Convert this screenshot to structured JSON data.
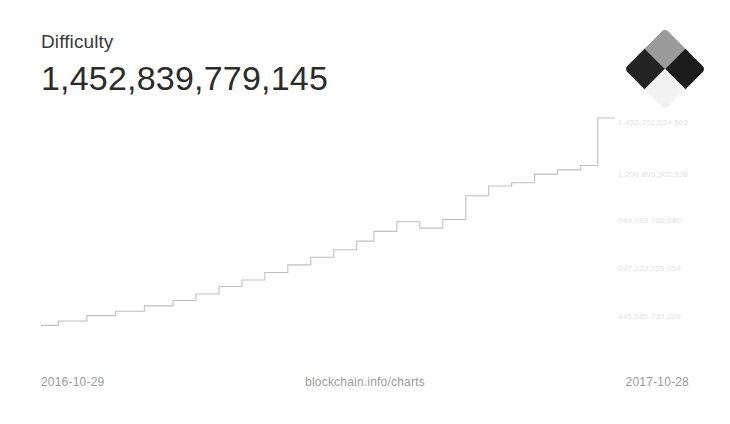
{
  "header": {
    "title": "Difficulty",
    "value": "1,452,839,779,145"
  },
  "logo": {
    "name": "blockchain-diamond-logo",
    "tiles": [
      "#9b9b9b",
      "#1c1c1c",
      "#242424",
      "#f2f2f2"
    ],
    "accent": "#8d8d8d"
  },
  "footer": {
    "date_start": "2016-10-29",
    "source": "blockchain.info/charts",
    "date_end": "2017-10-28"
  },
  "axis": {
    "y_labels": [
      "1,452,791,824,503",
      "1,200,895,302,336",
      "949,058,780,680",
      "697,222,259,054",
      "445,385,737,229"
    ],
    "y_label_tops": [
      118,
      170,
      216,
      264,
      312
    ],
    "line_color": "#c0c0c0",
    "label_color": "#e2e2e2"
  },
  "chart_data": {
    "type": "line",
    "title": "Difficulty",
    "subtitle": "1,452,839,779,145",
    "xlabel": "",
    "ylabel": "Difficulty",
    "source": "blockchain.info/charts",
    "grid": false,
    "legend": false,
    "x_range": [
      "2016-10-29",
      "2017-10-28"
    ],
    "ylim": [
      445385737229,
      1452791824503
    ],
    "y_ticks": [
      445385737229,
      697222259054,
      949058780680,
      1200895302336,
      1452791824503
    ],
    "y_tick_labels": [
      "445,385,737,229",
      "697,222,259,054",
      "949,058,780,680",
      "1,200,895,302,336",
      "1,452,791,824,503"
    ],
    "step_style": "staircase",
    "note": "Bitcoin mining difficulty retargets roughly every two weeks, producing a step pattern.",
    "x": [
      0,
      3,
      3,
      8,
      8,
      13,
      13,
      18,
      18,
      23,
      23,
      27,
      27,
      31,
      31,
      35,
      35,
      39,
      39,
      43,
      43,
      47,
      47,
      51,
      51,
      55,
      55,
      58,
      58,
      62,
      62,
      66,
      66,
      70,
      70,
      74,
      74,
      78,
      78,
      82,
      82,
      86,
      86,
      90,
      90,
      94,
      94,
      97,
      97,
      100
    ],
    "y": [
      4.0,
      4.0,
      6.0,
      6.0,
      8.5,
      8.5,
      10.5,
      10.5,
      13.0,
      13.0,
      15.5,
      15.5,
      18.5,
      18.5,
      22.0,
      22.0,
      25.0,
      25.0,
      28.5,
      28.5,
      32.0,
      32.0,
      35.5,
      35.5,
      39.0,
      39.0,
      43.0,
      43.0,
      47.5,
      47.5,
      52.0,
      52.0,
      49.0,
      49.0,
      53.0,
      53.0,
      64.0,
      64.0,
      68.5,
      68.5,
      70.0,
      70.0,
      74.0,
      74.0,
      76.0,
      76.0,
      78.0,
      78.0,
      100.0,
      100.0
    ],
    "series": [
      {
        "name": "Difficulty",
        "points_percent_of_range": [
          4.0,
          6.0,
          8.5,
          10.5,
          13.0,
          15.5,
          18.5,
          22.0,
          25.0,
          28.5,
          32.0,
          35.5,
          39.0,
          43.0,
          47.5,
          52.0,
          49.0,
          53.0,
          64.0,
          68.5,
          70.0,
          74.0,
          76.0,
          78.0,
          100.0
        ]
      }
    ]
  }
}
